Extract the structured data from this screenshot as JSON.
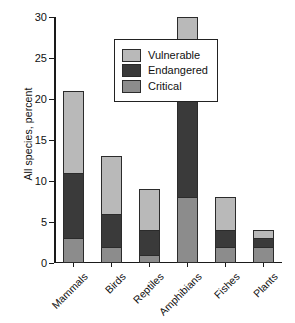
{
  "chart_data": {
    "type": "bar",
    "subtype": "stacked-vertical",
    "title": "",
    "xlabel": "",
    "ylabel": "All species, percent",
    "ylim": [
      0,
      30
    ],
    "ytick_step": 5,
    "yticks": [
      "0",
      "5",
      "10",
      "15",
      "20",
      "25",
      "30"
    ],
    "grid": false,
    "legend_position": "upper-left-inside",
    "categories": [
      "Mammals",
      "Birds",
      "Reptiles",
      "Amphibians",
      "Fishes",
      "Plants"
    ],
    "stack_order_bottom_to_top": [
      "Critical",
      "Endangered",
      "Vulnerable"
    ],
    "series": [
      {
        "name": "Vulnerable",
        "color": "#b9b9b9",
        "values": [
          10,
          7,
          5,
          10,
          4,
          1
        ]
      },
      {
        "name": "Endangered",
        "color": "#3a3a3a",
        "values": [
          8,
          4,
          3,
          12,
          2,
          1
        ]
      },
      {
        "name": "Critical",
        "color": "#8c8c8c",
        "values": [
          3,
          2,
          1,
          8,
          2,
          2
        ]
      }
    ],
    "totals": [
      21,
      13,
      9,
      30,
      8,
      4
    ]
  },
  "legend": {
    "items": [
      {
        "label": "Vulnerable",
        "color": "#b9b9b9"
      },
      {
        "label": "Endangered",
        "color": "#3a3a3a"
      },
      {
        "label": "Critical",
        "color": "#8c8c8c"
      }
    ]
  },
  "axis": {
    "y_title": "All species, percent"
  },
  "colors": {
    "vulnerable": "#b9b9b9",
    "endangered": "#3a3a3a",
    "critical": "#8c8c8c",
    "axis": "#1a1a1a",
    "bar_outline": "#2b2b2b",
    "background": "#ffffff"
  }
}
